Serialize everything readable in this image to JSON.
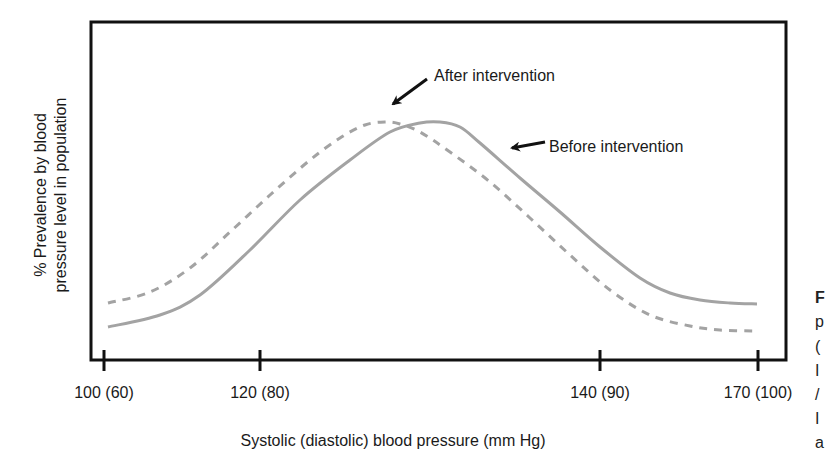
{
  "chart_data": {
    "type": "line",
    "title": "",
    "xlabel": "Systolic (diastolic) blood pressure (mm Hg)",
    "ylabel": "% Prevalence by blood pressure level in population",
    "ylabel_lines": [
      "% Prevalence by blood",
      "pressure level in population"
    ],
    "x_ticks": [
      {
        "label": "100 (60)",
        "px": 104
      },
      {
        "label": "120 (80)",
        "px": 260
      },
      {
        "label": "140 (90)",
        "px": 600
      },
      {
        "label": "170 (100)",
        "px": 758
      }
    ],
    "y_ticks": [],
    "grid": false,
    "ylim": [
      0,
      110
    ],
    "legend_position": "annotations",
    "series": [
      {
        "name": "Before intervention",
        "style": "solid",
        "color": "#a3a3a3",
        "points_px": [
          [
            108,
            327
          ],
          [
            160,
            315
          ],
          [
            200,
            295
          ],
          [
            250,
            250
          ],
          [
            300,
            200
          ],
          [
            350,
            160
          ],
          [
            390,
            132
          ],
          [
            420,
            123
          ],
          [
            440,
            122
          ],
          [
            460,
            127
          ],
          [
            480,
            143
          ],
          [
            520,
            178
          ],
          [
            560,
            212
          ],
          [
            600,
            247
          ],
          [
            640,
            278
          ],
          [
            670,
            293
          ],
          [
            700,
            300
          ],
          [
            730,
            303
          ],
          [
            757,
            304
          ]
        ],
        "relative_values": {
          "start": 14,
          "peak": 100,
          "end": 24
        }
      },
      {
        "name": "After intervention",
        "style": "dashed",
        "color": "#a3a3a3",
        "points_px": [
          [
            108,
            303
          ],
          [
            150,
            292
          ],
          [
            190,
            268
          ],
          [
            230,
            232
          ],
          [
            270,
            195
          ],
          [
            310,
            160
          ],
          [
            340,
            138
          ],
          [
            365,
            125
          ],
          [
            385,
            122
          ],
          [
            400,
            124
          ],
          [
            420,
            132
          ],
          [
            450,
            152
          ],
          [
            490,
            182
          ],
          [
            530,
            218
          ],
          [
            570,
            255
          ],
          [
            610,
            290
          ],
          [
            650,
            315
          ],
          [
            690,
            326
          ],
          [
            720,
            330
          ],
          [
            757,
            331
          ]
        ],
        "relative_values": {
          "start": 24,
          "peak": 100,
          "end": 12
        }
      }
    ],
    "annotations": [
      {
        "text": "After intervention",
        "x": 434,
        "y": 79,
        "arrow_from": [
          427,
          79
        ],
        "arrow_to": [
          392,
          105
        ]
      },
      {
        "text": "Before intervention",
        "x": 549,
        "y": 152,
        "arrow_from": [
          545,
          143
        ],
        "arrow_to": [
          511,
          148
        ]
      }
    ]
  },
  "caption_fragments": [
    "F",
    "p",
    "(",
    "I",
    "/",
    "I",
    "a"
  ]
}
